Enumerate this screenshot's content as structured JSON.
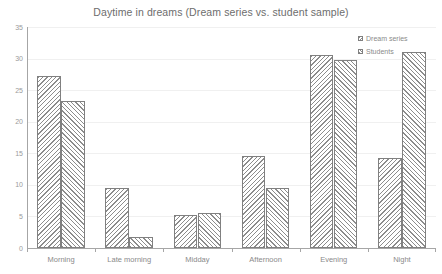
{
  "chart_data": {
    "type": "bar",
    "title": "Daytime in dreams (Dream series vs. student sample)",
    "xlabel": "",
    "ylabel": "",
    "categories": [
      "Morning",
      "Late morning",
      "Midday",
      "Afternoon",
      "Evening",
      "Night"
    ],
    "series": [
      {
        "name": "Dream series",
        "values": [
          27.3,
          9.5,
          5.3,
          14.5,
          30.5,
          14.3
        ]
      },
      {
        "name": "Students",
        "values": [
          23.3,
          1.7,
          5.5,
          9.5,
          29.7,
          31.0
        ]
      }
    ],
    "ylim": [
      0,
      35
    ],
    "yticks": [
      0,
      5,
      10,
      15,
      20,
      25,
      30,
      35
    ],
    "ytick_labels": [
      "0",
      "5",
      "10",
      "15",
      "20",
      "25",
      "30",
      "35"
    ],
    "grid": true,
    "grid_axis": "y",
    "legend_position": "top-right",
    "colors": {
      "bar_outline": "#808080",
      "hatch": "#8c8c8c",
      "bar_fill": "#ffffff",
      "axis": "#a6a6a6",
      "gridline": "#f0f0f0",
      "title_text": "#6d6d6d",
      "tick_text": "#9a9a9a",
      "background": "#ffffff"
    }
  },
  "legend": {
    "items": [
      {
        "label": "Dream series"
      },
      {
        "label": "Students"
      }
    ]
  }
}
